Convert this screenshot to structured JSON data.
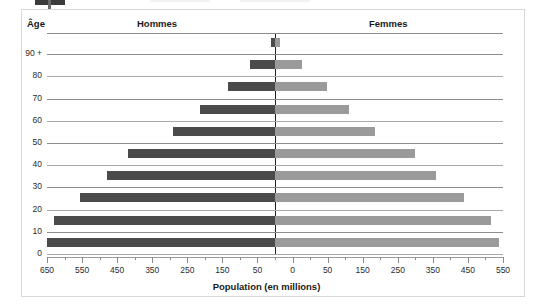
{
  "panel": {
    "header": {
      "age_label": "Âge",
      "left_label": "Hommes",
      "right_label": "Femmes"
    },
    "x_title": "Population (en millions)"
  },
  "chart_data": {
    "type": "bar",
    "subtype": "population-pyramid",
    "title": "",
    "xlabel": "Population (en millions)",
    "ylabel": "Âge",
    "grid": true,
    "legend_position": "top-inline",
    "orientation": "horizontal-diverging",
    "xlim": [
      -650,
      650
    ],
    "x_tick_values": [
      650,
      550,
      450,
      350,
      250,
      150,
      50,
      0,
      50,
      150,
      250,
      350,
      450,
      550,
      650
    ],
    "x_tick_labels": [
      "650",
      "550",
      "450",
      "350",
      "250",
      "150",
      "50",
      "0",
      "50",
      "150",
      "250",
      "350",
      "450",
      "550",
      "650"
    ],
    "x_minor_step": 50,
    "categories": [
      "90 +",
      "80",
      "70",
      "60",
      "50",
      "40",
      "30",
      "20",
      "10",
      "0"
    ],
    "series": [
      {
        "name": "Hommes",
        "color": "#4b4b4b",
        "values": [
          12,
          70,
          135,
          215,
          290,
          420,
          480,
          555,
          630,
          650
        ]
      },
      {
        "name": "Femmes",
        "color": "#9a9a9a",
        "values": [
          15,
          78,
          148,
          212,
          285,
          400,
          460,
          540,
          615,
          640
        ]
      }
    ]
  }
}
